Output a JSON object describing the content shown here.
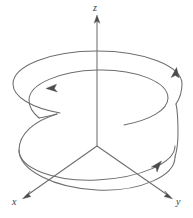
{
  "figure": {
    "type": "3d-coordinate-diagram",
    "background_color": "#ffffff",
    "stroke_color": "#6d6d6d",
    "arrow_color": "#4c4c4c",
    "label_color": "#3d3d3d"
  },
  "axes": {
    "origin": {
      "x": 97,
      "y": 146
    },
    "items": [
      {
        "id": "z",
        "label": "z",
        "direction": "up",
        "start": {
          "x": 97,
          "y": 146
        },
        "end": {
          "x": 97,
          "y": 16
        },
        "arrow": true
      },
      {
        "id": "x",
        "label": "x",
        "direction": "down-left",
        "start": {
          "x": 97,
          "y": 146
        },
        "end": {
          "x": 24,
          "y": 197
        },
        "arrow": true
      },
      {
        "id": "y",
        "label": "y",
        "direction": "down-right",
        "start": {
          "x": 97,
          "y": 146
        },
        "end": {
          "x": 171,
          "y": 197
        },
        "arrow": true
      }
    ]
  },
  "helix": {
    "description": "Two-turn helix spiralling upward and counterclockwise (viewed from +z) about the z-axis",
    "turns": 2,
    "center_x": 97,
    "radius_x": 78,
    "radius_y": 26,
    "top_center_y": 68,
    "bottom_center_y": 170,
    "direction": "counterclockwise-ascending",
    "endpoint": {
      "x": 39,
      "y": 118
    },
    "arrow_markers": [
      {
        "id": "arrow-upper-left",
        "x": 51,
        "y": 89,
        "angle": 196,
        "note": "upper turn, pointing left"
      },
      {
        "id": "arrow-right",
        "x": 174,
        "y": 73,
        "angle": 284,
        "note": "right side, pointing up"
      },
      {
        "id": "arrow-lower-right",
        "x": 157,
        "y": 166,
        "angle": 318,
        "note": "lower turn, pointing up-right"
      }
    ]
  },
  "labels": {
    "z": "z",
    "x": "x",
    "y": "y"
  }
}
